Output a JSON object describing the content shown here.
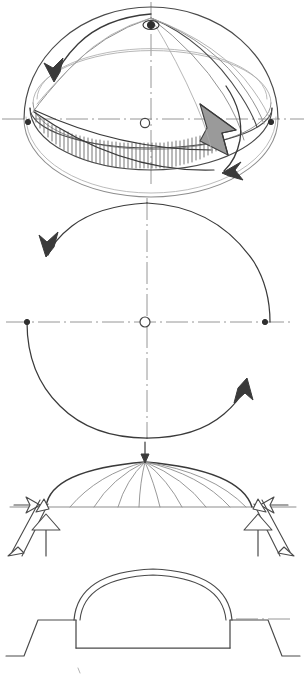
{
  "sheet": {
    "title": "Dome structural behaviour sketch",
    "background_color": "#ffffff",
    "ink_color": "#4a4a4a",
    "width": 306,
    "height": 675,
    "medium": "pencil on paper",
    "visible_text": []
  },
  "panels": [
    {
      "id": "panel-1",
      "name": "hemisphere-axonometric",
      "label": "Hemisphere with hoop ring and rotation arrows",
      "top": 0,
      "height": 190,
      "elements": [
        "hemisphere-outline",
        "latitude-ellipse-upper",
        "latitude-ellipse-equator",
        "latitude-ellipse-lower",
        "meridian-arcs",
        "hatched-hoop-band",
        "large-right-arrow",
        "upper-left-curved-arrow",
        "lower-right-curved-arrow",
        "apex-node",
        "center-node",
        "left-edge-node",
        "right-edge-node",
        "vertical-centerline",
        "horizontal-centerline"
      ]
    },
    {
      "id": "panel-2",
      "name": "plan-rotation-diagram",
      "label": "Plan view with rotation arrows",
      "top": 190,
      "height": 250,
      "elements": [
        "upper-rotation-arc-arrow",
        "lower-rotation-arc-arrow",
        "center-node",
        "left-node",
        "right-node",
        "vertical-centerline",
        "horizontal-centerline"
      ]
    },
    {
      "id": "panel-3",
      "name": "dome-elevation-forces",
      "label": "Dome elevation with meridian ribs and support reactions",
      "top": 440,
      "height": 130,
      "meridian_count": 9,
      "elements": [
        "dome-profile",
        "meridian-ribs",
        "springing-line",
        "crown-load-arrow",
        "left-thrust-arrow",
        "left-vertical-reaction-arrow",
        "right-thrust-arrow",
        "right-vertical-reaction-arrow"
      ]
    },
    {
      "id": "panel-4",
      "name": "dome-section",
      "label": "Dome section with walls and footings",
      "top": 560,
      "height": 115,
      "elements": [
        "shell-outer-line",
        "shell-inner-line",
        "left-wall",
        "right-wall",
        "floor-line",
        "left-footing",
        "right-footing"
      ]
    }
  ],
  "colors": {
    "ink": "#4a4a4a",
    "ink_dark": "#3a3a3a",
    "ink_light": "#8d8d8d",
    "ink_faint": "#a9a9a9",
    "hatch": "#5c5c5c",
    "arrow_fill": "#9a9a9a",
    "paper": "#ffffff"
  }
}
